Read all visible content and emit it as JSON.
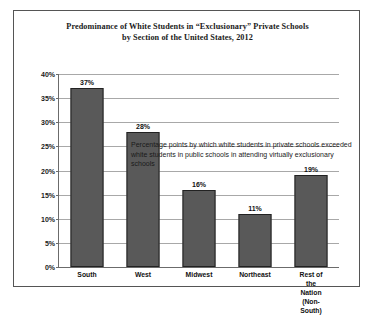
{
  "chart_data": {
    "type": "bar",
    "title": "Predominance of White Students in “Exclusionary” Private Schools by Section of the United States, 2012",
    "title_line1": "Predominance of White Students in “Exclusionary” Private Schools",
    "title_line2": "by Section of the United States, 2012",
    "categories": [
      "South",
      "West",
      "Midwest",
      "Northeast",
      "Rest of the Nation\n(Non-South)"
    ],
    "values": [
      37,
      28,
      16,
      11,
      19
    ],
    "value_labels": [
      "37%",
      "28%",
      "16%",
      "11%",
      "19%"
    ],
    "xlabel": "",
    "ylabel": "",
    "ylim": [
      0,
      40
    ],
    "ytick_values": [
      0,
      5,
      10,
      15,
      20,
      25,
      30,
      35,
      40
    ],
    "ytick_labels": [
      "0%",
      "5%",
      "10%",
      "15%",
      "20%",
      "25%",
      "30%",
      "35%",
      "40%"
    ],
    "grid": true,
    "legend": false,
    "annotation": "Percentage points by which white students in private schools exceeded white students in public schools in attending virtually exclusionary schools",
    "bar_color": "#595959",
    "bar_edge_color": "#222222",
    "gridline_color": "#a8a8a8",
    "axis_color": "#6b6b6b",
    "background_color": "#ffffff"
  }
}
